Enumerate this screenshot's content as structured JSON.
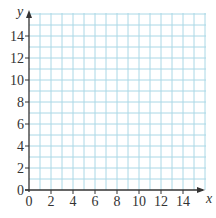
{
  "chart_data": {
    "type": "scatter",
    "title": "",
    "xlabel": "x",
    "ylabel": "y",
    "xlim": [
      0,
      16
    ],
    "ylim": [
      0,
      16
    ],
    "x_ticks": [
      0,
      2,
      4,
      6,
      8,
      10,
      12,
      14
    ],
    "y_ticks": [
      0,
      2,
      4,
      6,
      8,
      10,
      12,
      14
    ],
    "grid": true,
    "grid_step": 1,
    "series": [],
    "colors": {
      "grid": "#aad8e6",
      "axis": "#333333",
      "text": "#333333"
    }
  }
}
